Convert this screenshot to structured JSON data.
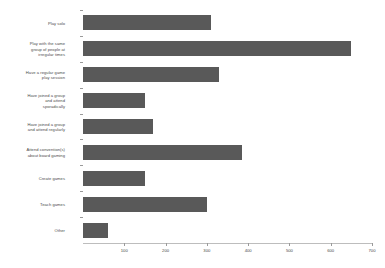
{
  "chart_data": {
    "type": "bar",
    "orientation": "horizontal",
    "title": "",
    "xlabel": "",
    "ylabel": "",
    "xlim": [
      0,
      700
    ],
    "grid": false,
    "legend": "none",
    "bar_color": "#595959",
    "axis_color": "#9a9a9a",
    "background": "#ffffff",
    "categories": [
      "Play solo",
      "Play with the same group of people at irregular times",
      "Have a regular game play session",
      "Have joined a group and attend sporadically",
      "Have joined a group and attend regularly",
      "Attend convention(s) about board gaming",
      "Create games",
      "Teach games",
      "Other"
    ],
    "category_lines": [
      [
        "Play solo"
      ],
      [
        "Play with the same",
        "group of people at",
        "irregular times"
      ],
      [
        "Have a regular game",
        "play session"
      ],
      [
        "Have joined a group",
        "and attend",
        "sporadically"
      ],
      [
        "Have joined a group",
        "and attend regularly"
      ],
      [
        "Attend convention(s)",
        "about board gaming"
      ],
      [
        "Create games"
      ],
      [
        "Teach games"
      ],
      [
        "Other"
      ]
    ],
    "values": [
      310,
      650,
      330,
      150,
      170,
      385,
      150,
      300,
      60
    ],
    "xticks": [
      100,
      200,
      300,
      400,
      500,
      600,
      700
    ],
    "xticklabels": [
      "100",
      "200",
      "300",
      "400",
      "500",
      "600",
      "700"
    ]
  }
}
